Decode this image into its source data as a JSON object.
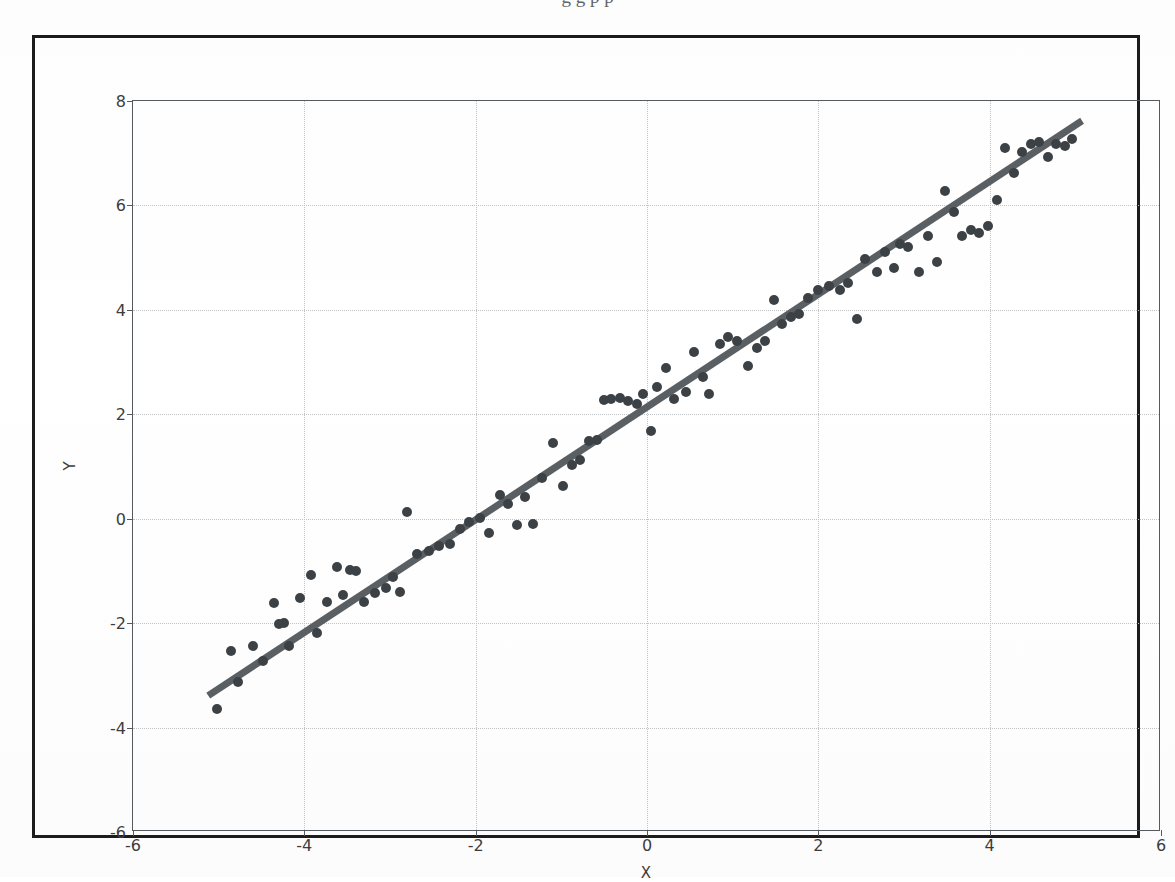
{
  "page": {
    "top_partial_text": "g g  p                              p",
    "background_color": "#ffffff",
    "frame_color": "#1c1c1c"
  },
  "chart_data": {
    "type": "scatter",
    "title": "",
    "xlabel": "X",
    "ylabel": "Y",
    "xlim": [
      -6,
      6
    ],
    "ylim": [
      -6,
      8
    ],
    "xticks": [
      -6,
      -4,
      -2,
      0,
      2,
      4,
      6
    ],
    "yticks": [
      -6,
      -4,
      -2,
      0,
      2,
      4,
      6,
      8
    ],
    "xticklabels": [
      "-6",
      "-4",
      "-2",
      "0",
      "2",
      "4",
      "6"
    ],
    "yticklabels": [
      "-6",
      "-4",
      "-2",
      "0",
      "2",
      "4",
      "6",
      "8"
    ],
    "grid": true,
    "grid_style": "dotted",
    "grid_color": "#bfc3c6",
    "legend": null,
    "point_color": "#3c4145",
    "point_size": 10,
    "line_color": "#5a5f63",
    "line_width": 7,
    "series": [
      {
        "name": "observations",
        "type": "scatter",
        "points": [
          [
            -5.02,
            -3.64
          ],
          [
            -4.86,
            -2.53
          ],
          [
            -4.78,
            -3.12
          ],
          [
            -4.6,
            -2.44
          ],
          [
            -4.48,
            -2.72
          ],
          [
            -4.35,
            -1.62
          ],
          [
            -4.3,
            -2.02
          ],
          [
            -4.24,
            -1.99
          ],
          [
            -4.18,
            -2.44
          ],
          [
            -4.05,
            -1.52
          ],
          [
            -3.92,
            -1.08
          ],
          [
            -3.85,
            -2.19
          ],
          [
            -3.74,
            -1.6
          ],
          [
            -3.62,
            -0.92
          ],
          [
            -3.55,
            -1.46
          ],
          [
            -3.47,
            -0.98
          ],
          [
            -3.4,
            -1.0
          ],
          [
            -3.3,
            -1.6
          ],
          [
            -3.18,
            -1.42
          ],
          [
            -3.05,
            -1.33
          ],
          [
            -2.96,
            -1.12
          ],
          [
            -2.88,
            -1.4
          ],
          [
            -2.8,
            0.12
          ],
          [
            -2.68,
            -0.68
          ],
          [
            -2.55,
            -0.62
          ],
          [
            -2.43,
            -0.52
          ],
          [
            -2.3,
            -0.48
          ],
          [
            -2.18,
            -0.2
          ],
          [
            -2.08,
            -0.06
          ],
          [
            -1.95,
            0.02
          ],
          [
            -1.85,
            -0.28
          ],
          [
            -1.72,
            0.46
          ],
          [
            -1.62,
            0.28
          ],
          [
            -1.52,
            -0.12
          ],
          [
            -1.42,
            0.42
          ],
          [
            -1.33,
            -0.1
          ],
          [
            -1.22,
            0.78
          ],
          [
            -1.1,
            1.45
          ],
          [
            -0.98,
            0.62
          ],
          [
            -0.88,
            1.02
          ],
          [
            -0.78,
            1.12
          ],
          [
            -0.68,
            1.48
          ],
          [
            -0.58,
            1.5
          ],
          [
            -0.5,
            2.28
          ],
          [
            -0.42,
            2.3
          ],
          [
            -0.32,
            2.32
          ],
          [
            -0.22,
            2.26
          ],
          [
            -0.12,
            2.2
          ],
          [
            -0.05,
            2.38
          ],
          [
            0.05,
            1.68
          ],
          [
            0.12,
            2.52
          ],
          [
            0.22,
            2.88
          ],
          [
            0.32,
            2.3
          ],
          [
            0.45,
            2.42
          ],
          [
            0.55,
            3.2
          ],
          [
            0.65,
            2.72
          ],
          [
            0.72,
            2.38
          ],
          [
            0.85,
            3.34
          ],
          [
            0.95,
            3.48
          ],
          [
            1.05,
            3.4
          ],
          [
            1.18,
            2.92
          ],
          [
            1.28,
            3.26
          ],
          [
            1.38,
            3.4
          ],
          [
            1.48,
            4.18
          ],
          [
            1.58,
            3.72
          ],
          [
            1.68,
            3.86
          ],
          [
            1.78,
            3.92
          ],
          [
            1.88,
            4.22
          ],
          [
            2.0,
            4.38
          ],
          [
            2.12,
            4.46
          ],
          [
            2.25,
            4.38
          ],
          [
            2.35,
            4.52
          ],
          [
            2.45,
            3.82
          ],
          [
            2.55,
            4.98
          ],
          [
            2.68,
            4.72
          ],
          [
            2.78,
            5.1
          ],
          [
            2.88,
            4.8
          ],
          [
            2.95,
            5.26
          ],
          [
            3.05,
            5.2
          ],
          [
            3.18,
            4.72
          ],
          [
            3.28,
            5.42
          ],
          [
            3.38,
            4.92
          ],
          [
            3.48,
            6.28
          ],
          [
            3.58,
            5.88
          ],
          [
            3.68,
            5.42
          ],
          [
            3.78,
            5.52
          ],
          [
            3.88,
            5.48
          ],
          [
            3.98,
            5.6
          ],
          [
            4.08,
            6.1
          ],
          [
            4.18,
            7.1
          ],
          [
            4.28,
            6.62
          ],
          [
            4.38,
            7.02
          ],
          [
            4.48,
            7.18
          ],
          [
            4.58,
            7.22
          ],
          [
            4.68,
            6.92
          ],
          [
            4.78,
            7.18
          ],
          [
            4.88,
            7.14
          ],
          [
            4.96,
            7.28
          ]
        ]
      },
      {
        "name": "fitted-line",
        "type": "line",
        "x0": -5.12,
        "y0": -3.42,
        "x1": 5.1,
        "y1": 7.62,
        "slope": 1.08,
        "intercept": 2.11
      }
    ]
  }
}
